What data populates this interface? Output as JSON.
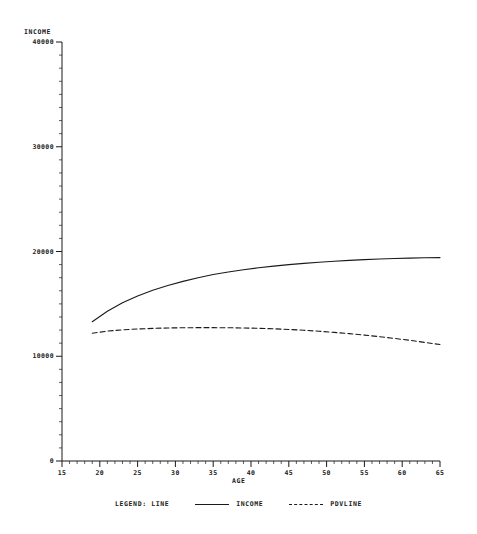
{
  "chart_data": {
    "type": "line",
    "title": "",
    "xlabel": "AGE",
    "ylabel": "INCOME",
    "xlim": [
      15,
      65
    ],
    "ylim": [
      0,
      40000
    ],
    "grid": false,
    "legend_position": "bottom",
    "legend_title": "LEGEND: LINE",
    "xticks": [
      15,
      20,
      25,
      30,
      35,
      40,
      45,
      50,
      55,
      60,
      65
    ],
    "xtick_labels": [
      "15",
      "20",
      "25",
      "30",
      "35",
      "40",
      "45",
      "50",
      "55",
      "60",
      "65"
    ],
    "yticks": [
      0,
      10000,
      20000,
      30000,
      40000
    ],
    "ytick_labels": [
      "0",
      "10000",
      "20000",
      "30000",
      "40000"
    ],
    "x": [
      19,
      21,
      23,
      25,
      27,
      29,
      31,
      33,
      35,
      37,
      39,
      41,
      43,
      45,
      47,
      49,
      51,
      53,
      55,
      57,
      59,
      61,
      63,
      65
    ],
    "series": [
      {
        "name": "INCOME",
        "style": "solid",
        "color": "#1a1a1a",
        "values": [
          13300,
          14300,
          15100,
          15750,
          16300,
          16750,
          17150,
          17500,
          17800,
          18050,
          18250,
          18450,
          18600,
          18750,
          18870,
          18980,
          19070,
          19150,
          19220,
          19280,
          19330,
          19370,
          19400,
          19420
        ]
      },
      {
        "name": "PDVLINE",
        "style": "dashed",
        "color": "#1a1a1a",
        "values": [
          12200,
          12400,
          12520,
          12600,
          12660,
          12700,
          12720,
          12730,
          12730,
          12720,
          12700,
          12670,
          12620,
          12560,
          12480,
          12390,
          12280,
          12160,
          12020,
          11870,
          11700,
          11520,
          11320,
          11120
        ]
      }
    ]
  },
  "legend": {
    "title": "LEGEND: LINE",
    "entries": [
      {
        "label": "INCOME",
        "style": "solid"
      },
      {
        "label": "PDVLINE",
        "style": "dashed"
      }
    ]
  }
}
